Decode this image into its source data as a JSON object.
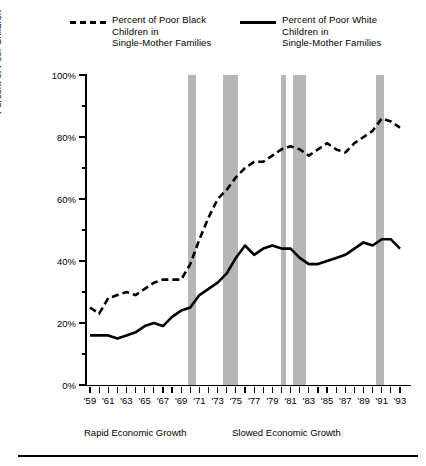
{
  "legend": {
    "entries": [
      {
        "name": "poor-black-children",
        "style": "dashed",
        "label": "Percent of Poor Black\nChildren in\nSingle-Mother Families"
      },
      {
        "name": "poor-white-children",
        "style": "solid",
        "label": "Percent of Poor White\nChildren in\nSingle-Mother Families"
      }
    ]
  },
  "annotations": {
    "left": "Rapid Economic Growth",
    "right": "Slowed Economic Growth"
  },
  "chart_data": {
    "type": "line",
    "title": "",
    "xlabel": "",
    "ylabel": "Percent of Poor Children",
    "xlim": [
      1959,
      1993
    ],
    "ylim": [
      0,
      100
    ],
    "grid": false,
    "legend_position": "top",
    "ytick_labels": [
      "0%",
      "20%",
      "40%",
      "60%",
      "80%",
      "100%"
    ],
    "ytick_values": [
      0,
      20,
      40,
      60,
      80,
      100
    ],
    "yminor_values": [
      10,
      30,
      50,
      70,
      90
    ],
    "xtick_labels": [
      "'59",
      "'61",
      "'63",
      "'65",
      "'67",
      "'69",
      "'71",
      "'73",
      "'75",
      "'77",
      "'79",
      "'81",
      "'83",
      "'85",
      "'87",
      "'89",
      "'91",
      "'93"
    ],
    "xtick_values": [
      1959,
      1961,
      1963,
      1965,
      1967,
      1969,
      1971,
      1973,
      1975,
      1977,
      1979,
      1981,
      1983,
      1985,
      1987,
      1989,
      1991,
      1993
    ],
    "x": [
      1959,
      1960,
      1961,
      1962,
      1963,
      1964,
      1965,
      1966,
      1967,
      1968,
      1969,
      1970,
      1971,
      1972,
      1973,
      1974,
      1975,
      1976,
      1977,
      1978,
      1979,
      1980,
      1981,
      1982,
      1983,
      1984,
      1985,
      1986,
      1987,
      1988,
      1989,
      1990,
      1991,
      1992,
      1993
    ],
    "series": [
      {
        "name": "Percent of Poor Black Children in Single-Mother Families",
        "style": "dashed",
        "color": "#000000",
        "values": [
          25,
          23,
          28,
          29,
          30,
          29,
          31,
          33,
          34,
          34,
          34,
          39,
          47,
          54,
          60,
          63,
          67,
          70,
          72,
          72,
          74,
          76,
          77,
          76,
          74,
          76,
          78,
          76,
          75,
          78,
          80,
          82,
          86,
          85,
          83
        ]
      },
      {
        "name": "Percent of Poor White Children in Single-Mother Families",
        "style": "solid",
        "color": "#000000",
        "values": [
          16,
          16,
          16,
          15,
          16,
          17,
          19,
          20,
          19,
          22,
          24,
          25,
          29,
          31,
          33,
          36,
          41,
          45,
          42,
          44,
          45,
          44,
          44,
          41,
          39,
          39,
          40,
          41,
          42,
          44,
          46,
          45,
          47,
          47,
          44
        ]
      }
    ],
    "recession_bands": [
      {
        "start": 1969.7,
        "end": 1970.6
      },
      {
        "start": 1973.6,
        "end": 1975.2
      },
      {
        "start": 1979.9,
        "end": 1980.5
      },
      {
        "start": 1981.3,
        "end": 1982.7
      },
      {
        "start": 1990.4,
        "end": 1991.2
      }
    ],
    "recession_band_color": "#b6b6b6"
  }
}
